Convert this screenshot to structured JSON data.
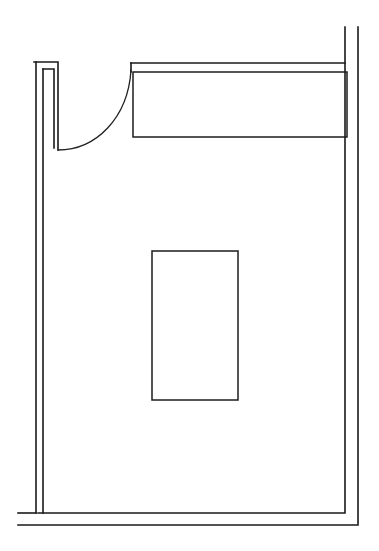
{
  "drawing": {
    "type": "architectural-floor-plan",
    "title": "Floor Plan",
    "canvas": {
      "width": 379,
      "height": 551
    },
    "background_color": "#ffffff",
    "line_color": "#1a1a1a",
    "style": "monochrome line drawing, no text labels, no dimensions",
    "label_text": ""
  },
  "geometry": {
    "outer_wall": {
      "name": "exterior-wall-outline",
      "points": "358,27 358,525 18,525",
      "color": "#1a1a1a",
      "stroke_width": 1.6
    },
    "inner_wall": {
      "name": "interior-wall-face",
      "points": "345,27 345,513 38,513 38,62 34,62 34,513 18,513",
      "color": "#1a1a1a",
      "stroke_width": 1.6
    },
    "top_wall_outer": {
      "name": "top-wall-outer-edge",
      "points": "34,62 58,62 58,150",
      "color": "#1a1a1a"
    },
    "top_wall_inner": {
      "name": "top-wall-inner-edge",
      "points": "43,69 54,69 54,148",
      "color": "#1a1a1a"
    },
    "left_pilaster": {
      "name": "left-wall-pilaster",
      "x": 34,
      "y": 62,
      "width": 24,
      "height": 88
    },
    "top_header_line": {
      "name": "top-header-line",
      "points": "131,63 345,63",
      "color": "#1a1a1a"
    },
    "counter_block": {
      "name": "upper-counter-block",
      "x": 133,
      "y": 72,
      "width": 214,
      "height": 65,
      "color": "#1a1a1a"
    },
    "door_swing_arc": {
      "name": "door-swing-arc",
      "start": "58,150",
      "end": "131,70",
      "radius": 78,
      "sweep": "counter-clockwise",
      "color": "#1f1f1f"
    },
    "center_island": {
      "name": "center-island-fixture",
      "x": 152,
      "y": 251,
      "width": 86,
      "height": 149,
      "color": "#1c1c1c"
    }
  },
  "elements": [
    {
      "id": "exterior-wall",
      "label": "Exterior wall",
      "kind": "wall"
    },
    {
      "id": "interior-wall",
      "label": "Interior wall face",
      "kind": "wall"
    },
    {
      "id": "left-pilaster",
      "label": "Wall pilaster / door jamb",
      "kind": "wall"
    },
    {
      "id": "door-swing",
      "label": "Door swing arc",
      "kind": "opening"
    },
    {
      "id": "upper-counter",
      "label": "Upper counter / casework",
      "kind": "fixture"
    },
    {
      "id": "center-island",
      "label": "Center island",
      "kind": "fixture"
    },
    {
      "id": "room-interior",
      "label": "Room interior",
      "kind": "space"
    }
  ]
}
